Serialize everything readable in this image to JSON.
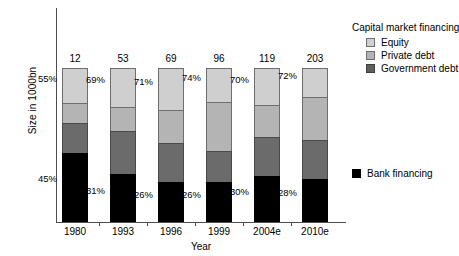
{
  "chart_data": {
    "type": "bar",
    "subtype": "stacked-bar-100-percent",
    "title": "",
    "xlabel": "Year",
    "ylabel": "Size in 1000bn",
    "categories": [
      "1980",
      "1993",
      "1996",
      "1999",
      "2004e",
      "2010e"
    ],
    "totals": [
      12,
      53,
      69,
      96,
      119,
      203
    ],
    "total_unit": "1000bn",
    "grid": false,
    "legend_position": "right",
    "series": [
      {
        "name": "Equity",
        "color": "#cfcfcf",
        "values": [
          23,
          25,
          27,
          22,
          24,
          19
        ]
      },
      {
        "name": "Private debt",
        "color": "#b4b4b4",
        "values": [
          13,
          16,
          22,
          32,
          21,
          28
        ]
      },
      {
        "name": "Government debt",
        "color": "#6b6b6b",
        "values": [
          19,
          28,
          25,
          20,
          25,
          25
        ]
      },
      {
        "name": "Bank financing",
        "color": "#000000",
        "values": [
          45,
          31,
          26,
          26,
          30,
          28
        ]
      }
    ],
    "annotations": {
      "capital_market_pct": [
        "55%",
        "69%",
        "71%",
        "74%",
        "70%",
        "72%"
      ],
      "bank_pct": [
        "45%",
        "31%",
        "26%",
        "26%",
        "30%",
        "28%"
      ]
    }
  },
  "bars": [
    {
      "category": "1980",
      "total": "12",
      "pct_top": "55%",
      "pct_bottom": "45%",
      "equity": 23,
      "private": 13,
      "govt": 19,
      "bank": 45
    },
    {
      "category": "1993",
      "total": "53",
      "pct_top": "69%",
      "pct_bottom": "31%",
      "equity": 25,
      "private": 16,
      "govt": 28,
      "bank": 31
    },
    {
      "category": "1996",
      "total": "69",
      "pct_top": "71%",
      "pct_bottom": "26%",
      "equity": 27,
      "private": 22,
      "govt": 25,
      "bank": 26
    },
    {
      "category": "1999",
      "total": "96",
      "pct_top": "74%",
      "pct_bottom": "26%",
      "equity": 22,
      "private": 32,
      "govt": 20,
      "bank": 26
    },
    {
      "category": "2004e",
      "total": "119",
      "pct_top": "70%",
      "pct_bottom": "30%",
      "equity": 24,
      "private": 21,
      "govt": 25,
      "bank": 30
    },
    {
      "category": "2010e",
      "total": "203",
      "pct_top": "72%",
      "pct_bottom": "28%",
      "equity": 19,
      "private": 28,
      "govt": 25,
      "bank": 28
    }
  ],
  "axes": {
    "y_title": "Size in 1000bn",
    "x_title": "Year"
  },
  "legend": {
    "capital_market_title": "Capital market financing",
    "items": [
      {
        "label": "Equity",
        "swatch": "sw-equity"
      },
      {
        "label": "Private debt",
        "swatch": "sw-private"
      },
      {
        "label": "Government debt",
        "swatch": "sw-govt"
      }
    ],
    "bank": {
      "label": "Bank financing",
      "swatch": "sw-bank"
    }
  }
}
